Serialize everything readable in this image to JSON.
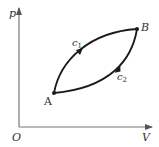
{
  "diagram": {
    "type": "pV-diagram",
    "axes": {
      "origin_label": "O",
      "x_label": "V",
      "y_label": "p"
    },
    "points": [
      {
        "name": "A",
        "label": "A"
      },
      {
        "name": "B",
        "label": "B"
      }
    ],
    "paths": [
      {
        "name": "c1",
        "label": "c",
        "subscript": "1",
        "direction": "A to B (upper curve)"
      },
      {
        "name": "c2",
        "label": "c",
        "subscript": "2",
        "direction": "B to A (lower curve)"
      }
    ],
    "colors": {
      "axis": "#777777",
      "curve": "#1a1a1a",
      "text": "#333333"
    }
  }
}
